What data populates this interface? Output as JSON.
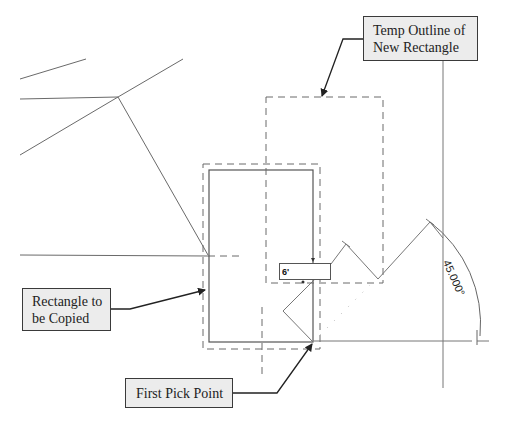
{
  "callouts": {
    "temp_outline": {
      "line1": "Temp Outline of",
      "line2": "New Rectangle"
    },
    "rectangle_to_copy": {
      "line1": "Rectangle to",
      "line2": "be Copied"
    },
    "first_pick_point": {
      "label": "First Pick Point"
    }
  },
  "length_input": {
    "value": "6'"
  },
  "angle": {
    "label": "45.000°"
  },
  "colors": {
    "line": "#6a6a6a",
    "dashed": "#6a6a6a",
    "callout_bg": "#ececec",
    "callout_border": "#3a3a3a",
    "arrow": "#222222"
  }
}
